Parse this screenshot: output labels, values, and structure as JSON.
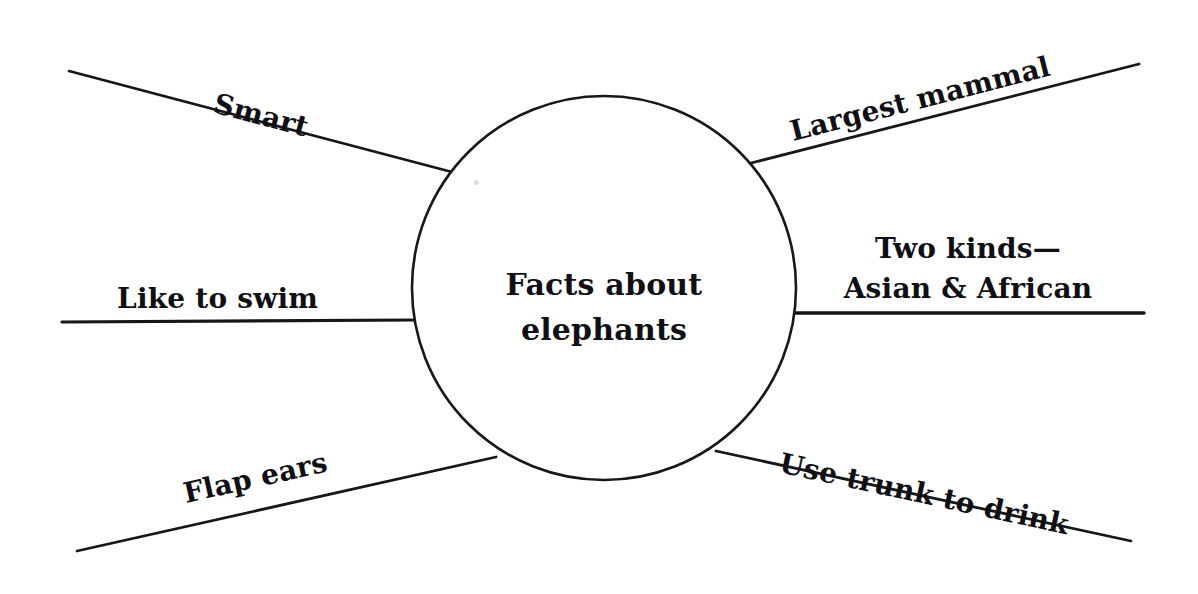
{
  "diagram": {
    "type": "word-web",
    "hub": {
      "line1": "Facts about",
      "line2": "elephants"
    },
    "colors": {
      "ink": "#17171a",
      "background": "#ffffff"
    },
    "branches": [
      {
        "id": "smart",
        "label": "Smart",
        "position": "top-left",
        "orientation": "diagonal-descending"
      },
      {
        "id": "like-to-swim",
        "label": "Like to swim",
        "position": "middle-left",
        "orientation": "horizontal"
      },
      {
        "id": "flap-ears",
        "label": "Flap ears",
        "position": "bottom-left",
        "orientation": "diagonal-ascending"
      },
      {
        "id": "largest-mammal",
        "label": "Largest mammal",
        "position": "top-right",
        "orientation": "diagonal-ascending"
      },
      {
        "id": "two-kinds",
        "label_line1": "Two kinds—",
        "label_line2": "Asian & African",
        "position": "middle-right",
        "orientation": "horizontal"
      },
      {
        "id": "use-trunk-to-drink",
        "label": "Use trunk to drink",
        "position": "bottom-right",
        "orientation": "diagonal-descending"
      }
    ]
  }
}
